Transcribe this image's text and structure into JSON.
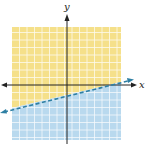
{
  "graph": {
    "type": "linear inequality",
    "x_axis_label": "x",
    "y_axis_label": "y",
    "boundary_line": {
      "style": "dashed",
      "color": "#2e7fa3",
      "description": "boundary line with positive slope crossing y-axis below origin"
    },
    "regions": [
      {
        "name": "above-line",
        "color": "#f5e08a"
      },
      {
        "name": "below-line",
        "color": "#b9d9ee"
      }
    ],
    "grid_color": "#ffffff",
    "axis_color": "#222222"
  }
}
